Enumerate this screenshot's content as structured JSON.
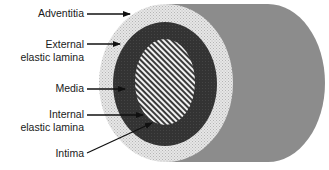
{
  "diagram": {
    "labels": [
      {
        "id": "adventitia",
        "lines": [
          "Adventitia"
        ]
      },
      {
        "id": "external-elastic-lamina",
        "lines": [
          "External",
          "elastic lamina"
        ]
      },
      {
        "id": "media",
        "lines": [
          "Media"
        ]
      },
      {
        "id": "internal-elastic-lamina",
        "lines": [
          "Internal",
          "elastic lamina"
        ]
      },
      {
        "id": "intima",
        "lines": [
          "Intima"
        ]
      }
    ],
    "colors": {
      "vessel_body": "#8c8c8c",
      "adventitia": "#d9d9d9",
      "media": "#333333",
      "intima_stripe_dark": "#3a3a3a",
      "intima_stripe_light": "#f2f2f2",
      "arrow": "#111111"
    }
  }
}
